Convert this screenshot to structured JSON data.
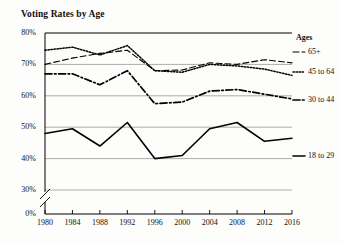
{
  "chart_data": {
    "type": "line",
    "title": "Voting Rates by Age",
    "xlabel": "",
    "ylabel": "",
    "x": [
      1980,
      1984,
      1988,
      1992,
      1996,
      2000,
      2004,
      2008,
      2012,
      2016
    ],
    "xtick_labels": [
      "1980",
      "1984",
      "1988",
      "1992",
      "1996",
      "2000",
      "2004",
      "2008",
      "2012",
      "2016"
    ],
    "ytick_labels": [
      "0%",
      "30%",
      "40%",
      "50%",
      "60%",
      "70%",
      "80%"
    ],
    "ytick_values": [
      0,
      30,
      40,
      50,
      60,
      70,
      80
    ],
    "ylim": [
      30,
      80
    ],
    "axis_break": true,
    "axis_break_between": [
      0,
      30
    ],
    "grid": true,
    "grid_axis": "y",
    "legend_position": "right-inline",
    "legend_title": "Ages",
    "series": [
      {
        "name": "65+",
        "style": "dashed",
        "values": [
          70.0,
          72.0,
          73.5,
          74.5,
          68.0,
          68.2,
          70.5,
          70.0,
          71.5,
          70.5
        ]
      },
      {
        "name": "45 to 64",
        "style": "dotted",
        "values": [
          74.5,
          75.5,
          73.0,
          76.0,
          68.0,
          67.5,
          70.0,
          69.5,
          68.5,
          66.5
        ]
      },
      {
        "name": "30 to 44",
        "style": "dash-dot",
        "values": [
          67.0,
          67.0,
          63.5,
          68.0,
          57.5,
          58.0,
          61.5,
          62.0,
          60.5,
          59.0
        ]
      },
      {
        "name": "18 to 29",
        "style": "solid",
        "values": [
          48.0,
          49.5,
          44.0,
          51.5,
          40.0,
          41.0,
          49.5,
          51.5,
          45.5,
          46.5
        ]
      }
    ]
  },
  "colors": {
    "line": "#000000",
    "grid": "#8a8a8a",
    "axis": "#000000",
    "background": "#fdfdfb"
  }
}
